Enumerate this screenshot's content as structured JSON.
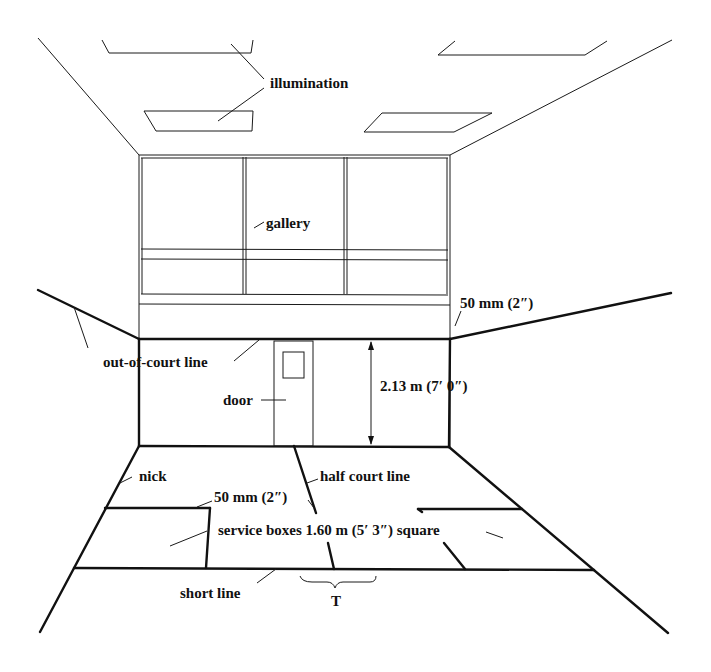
{
  "diagram": {
    "labels": {
      "illumination": "illumination",
      "gallery": "gallery",
      "tin_height": "50 mm (2″)",
      "out_of_court_line": "out-of-court line",
      "door": "door",
      "back_wall_line_height": "2.13 m (7′ 0″)",
      "nick": "nick",
      "half_court_line": "half court line",
      "line_width": "50 mm (2″)",
      "service_boxes": "service boxes 1.60 m (5′ 3″) square",
      "short_line": "short line",
      "t": "T"
    },
    "colors": {
      "line": "#111111",
      "background": "#ffffff"
    }
  }
}
